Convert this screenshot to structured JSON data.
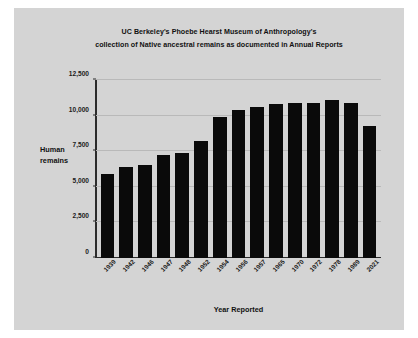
{
  "figure": {
    "background_color": "#d4d4d4",
    "bar_color": "#0a0a0a",
    "grid_color": "#b9b9b9"
  },
  "title_line1": "UC Berkeley's Phoebe Hearst Museum of Anthropology's",
  "title_line2": "collection of Native ancestral remains as documented in Annual Reports",
  "chart_data": {
    "type": "bar",
    "title": "UC Berkeley's Phoebe Hearst Museum of Anthropology's collection of Native ancestral remains as documented in Annual Reports",
    "xlabel": "Year Reported",
    "ylabel": "Human remains",
    "categories": [
      "1939",
      "1942",
      "1946",
      "1947",
      "1948",
      "1952",
      "1954",
      "1956",
      "1957",
      "1965",
      "1970",
      "1972",
      "1978",
      "1989",
      "2021"
    ],
    "values": [
      5900,
      6400,
      6500,
      7200,
      7400,
      8200,
      9900,
      10400,
      10600,
      10800,
      10900,
      10900,
      11100,
      10900,
      9300
    ],
    "ylim": [
      0,
      12500
    ],
    "yticks": [
      0,
      2500,
      5000,
      7500,
      10000,
      12500
    ],
    "ytick_labels": [
      "0",
      "2,500",
      "5,000",
      "7,500",
      "10,000",
      "12,500"
    ],
    "grid": true,
    "legend": false
  }
}
